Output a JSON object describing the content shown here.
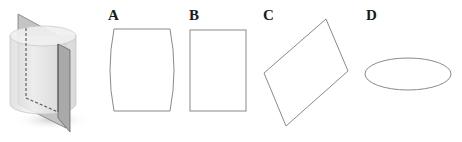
{
  "figure": {
    "solid": "cylinder",
    "cutting_plane": "vertical plane containing axis"
  },
  "options": [
    {
      "id": "A",
      "label": "A",
      "shape": "rectangle with curved sides"
    },
    {
      "id": "B",
      "label": "B",
      "shape": "rectangle"
    },
    {
      "id": "C",
      "label": "C",
      "shape": "parallelogram"
    },
    {
      "id": "D",
      "label": "D",
      "shape": "ellipse"
    }
  ],
  "colors": {
    "outline": "#8a8a8a",
    "cylinder_fill": "#ececec",
    "plane_fill": "#b9b9b9",
    "plane_edge": "#6e6e6e"
  }
}
